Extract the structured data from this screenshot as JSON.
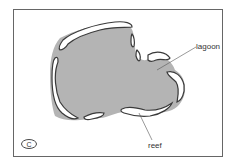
{
  "diagram": {
    "panel_label": "C",
    "labels": {
      "lagoon": "lagoon",
      "reef": "reef"
    },
    "colors": {
      "lagoon_fill": "#b4b4b4",
      "reef_fill": "#ffffff",
      "reef_outline": "#3a3a3a",
      "frame": "#555555"
    }
  }
}
